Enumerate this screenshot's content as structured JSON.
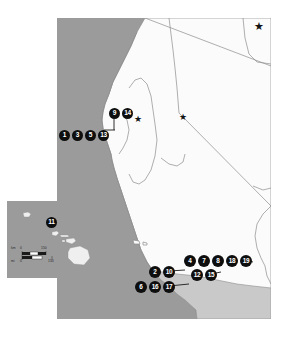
{
  "figure": {
    "kind": "locator-map",
    "colors": {
      "ocean": "#9b9b9b",
      "land": "#fbfbfb",
      "secondary_land": "#c9c9c9",
      "border_line": "#8d8d8d",
      "marker_fill": "#0e0e0e",
      "marker_text": "#ffffff",
      "panel_border": "#c8c8c8"
    }
  },
  "main_map": {
    "name": "california-nevada-map",
    "marker_groups": [
      {
        "name": "north-coast-row",
        "markers": [
          "1",
          "3",
          "5",
          "13"
        ]
      },
      {
        "name": "sacramento-delta-row",
        "markers": [
          "9",
          "14"
        ]
      },
      {
        "name": "south-coast-top-row",
        "markers": [
          "4",
          "7",
          "8",
          "18",
          "19"
        ]
      },
      {
        "name": "south-coast-middle-row",
        "markers": [
          "2",
          "10",
          "12",
          "15"
        ]
      },
      {
        "name": "south-coast-bottom-row",
        "markers": [
          "6",
          "16",
          "17"
        ]
      }
    ],
    "markers": [
      {
        "id": "1",
        "label": "1",
        "x": 2,
        "y": 112,
        "size": "m1"
      },
      {
        "id": "3",
        "label": "3",
        "x": 15,
        "y": 112,
        "size": "m1"
      },
      {
        "id": "5",
        "label": "5",
        "x": 28,
        "y": 112,
        "size": "m1"
      },
      {
        "id": "13",
        "label": "13",
        "x": 41,
        "y": 112,
        "size": "m1"
      },
      {
        "id": "9",
        "label": "9",
        "x": 52,
        "y": 94,
        "size": "m1"
      },
      {
        "id": "14",
        "label": "14",
        "x": 65,
        "y": 94,
        "size": "m1"
      },
      {
        "id": "4",
        "label": "4",
        "x": 127,
        "y": 242,
        "size": "m2"
      },
      {
        "id": "7",
        "label": "7",
        "x": 141,
        "y": 242,
        "size": "m2"
      },
      {
        "id": "8",
        "label": "8",
        "x": 155,
        "y": 242,
        "size": "m2"
      },
      {
        "id": "18",
        "label": "18",
        "x": 169,
        "y": 242,
        "size": "m2"
      },
      {
        "id": "19",
        "label": "19",
        "x": 183,
        "y": 242,
        "size": "m2"
      },
      {
        "id": "2",
        "label": "2",
        "x": 92,
        "y": 253,
        "size": "m2"
      },
      {
        "id": "10",
        "label": "10",
        "x": 106,
        "y": 253,
        "size": "m2"
      },
      {
        "id": "12",
        "label": "12",
        "x": 134,
        "y": 256,
        "size": "m2"
      },
      {
        "id": "15",
        "label": "15",
        "x": 148,
        "y": 256,
        "size": "m2"
      },
      {
        "id": "6",
        "label": "6",
        "x": 78,
        "y": 268,
        "size": "m2"
      },
      {
        "id": "16",
        "label": "16",
        "x": 92,
        "y": 268,
        "size": "m2"
      },
      {
        "id": "17",
        "label": "17",
        "x": 106,
        "y": 268,
        "size": "m2"
      }
    ],
    "capital_stars": [
      {
        "name": "capital-star-northeast",
        "x": 197,
        "y": 3,
        "glyph": "★"
      },
      {
        "name": "capital-star-sacramento",
        "x": 77,
        "y": 97,
        "glyph": "★"
      },
      {
        "name": "capital-star-carson-city",
        "x": 122,
        "y": 95,
        "glyph": "★"
      }
    ]
  },
  "inset_map": {
    "name": "hawaii-inset",
    "markers": [
      {
        "id": "11",
        "label": "11",
        "x": 38,
        "y": 20,
        "size": "m1"
      }
    ],
    "scalebar": {
      "name": "inset-scalebar",
      "km_unit": "km",
      "km_zero": "0",
      "km_max": "150",
      "mi_unit": "mi",
      "mi_zero": "0",
      "mi_max": "150"
    }
  }
}
